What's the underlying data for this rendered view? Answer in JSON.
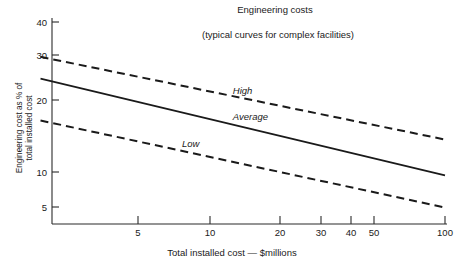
{
  "chart_data": {
    "type": "line",
    "title": "Engineering costs",
    "subtitle": "(typical curves for complex facilities)",
    "xlabel": "Total installed cost — $millions",
    "ylabel_line1": "Engineering cost as % of",
    "ylabel_line2": "total installed cost",
    "xscale": "log",
    "yscale": "log",
    "xlim": [
      1.7,
      100
    ],
    "ylim": [
      4.3,
      40
    ],
    "grid": false,
    "legend_position": "inline-annotations",
    "xticks": [
      5,
      10,
      20,
      30,
      40,
      50,
      100
    ],
    "xtick_labels": [
      "5",
      "10",
      "20",
      "30",
      "40",
      "50",
      "100"
    ],
    "yticks": [
      5,
      10,
      20,
      30,
      40
    ],
    "ytick_labels": [
      "5",
      "10",
      "20",
      "30",
      "40"
    ],
    "series": [
      {
        "name": "High",
        "style": "dashed",
        "color": "#1a1a1a",
        "x": [
          1.9,
          100
        ],
        "values": [
          29.0,
          13.5
        ],
        "label_x": 12.5,
        "label_y": 20.6
      },
      {
        "name": "Average",
        "style": "solid",
        "color": "#1a1a1a",
        "x": [
          1.9,
          100
        ],
        "values": [
          23.7,
          9.7
        ],
        "label_x": 12.5,
        "label_y": 16.2
      },
      {
        "name": "Low",
        "style": "dashed",
        "color": "#1a1a1a",
        "x": [
          1.9,
          100
        ],
        "values": [
          16.1,
          7.2
        ],
        "label_x": 7.6,
        "label_y": 12.6
      }
    ]
  },
  "figure": {
    "background_color": "#ffffff",
    "axis_color": "#2b2b2b"
  }
}
